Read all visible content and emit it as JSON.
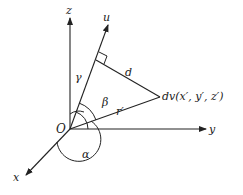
{
  "diagram": {
    "type": "3d-coordinate-geometry",
    "axes": {
      "x": "x",
      "y": "y",
      "z": "z",
      "u": "u"
    },
    "origin": "O",
    "labels": {
      "gamma": "γ",
      "beta": "β",
      "alpha": "α",
      "d": "d",
      "r_prime": "r′",
      "point": "dv(x′, y′, z′)"
    },
    "colors": {
      "stroke": "#222222",
      "background": "#ffffff"
    }
  }
}
